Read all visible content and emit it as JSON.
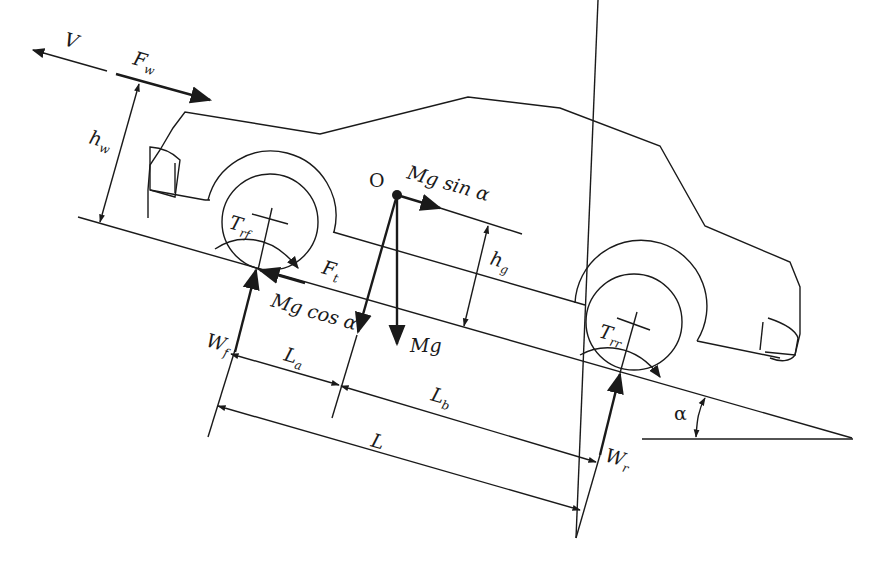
{
  "diagram": {
    "labels": {
      "velocity": "V",
      "wind_force": "F",
      "wind_force_sub": "w",
      "wind_height": "h",
      "wind_height_sub": "w",
      "cg_point": "O",
      "mg_sin": "Mg sin α",
      "mg_cos": "Mg cos α",
      "mg": "Mg",
      "cg_height": "h",
      "cg_height_sub": "g",
      "front_torque": "T",
      "front_torque_sub": "rf",
      "rear_torque": "T",
      "rear_torque_sub": "rr",
      "traction_force": "F",
      "traction_force_sub": "t",
      "front_load": "W",
      "front_load_sub": "f",
      "rear_load": "W",
      "rear_load_sub": "r",
      "dist_a": "L",
      "dist_a_sub": "a",
      "dist_b": "L",
      "dist_b_sub": "b",
      "wheelbase": "L",
      "slope_angle": "α"
    },
    "colors": {
      "ink": "#1a1a1a",
      "background": "#ffffff"
    }
  }
}
